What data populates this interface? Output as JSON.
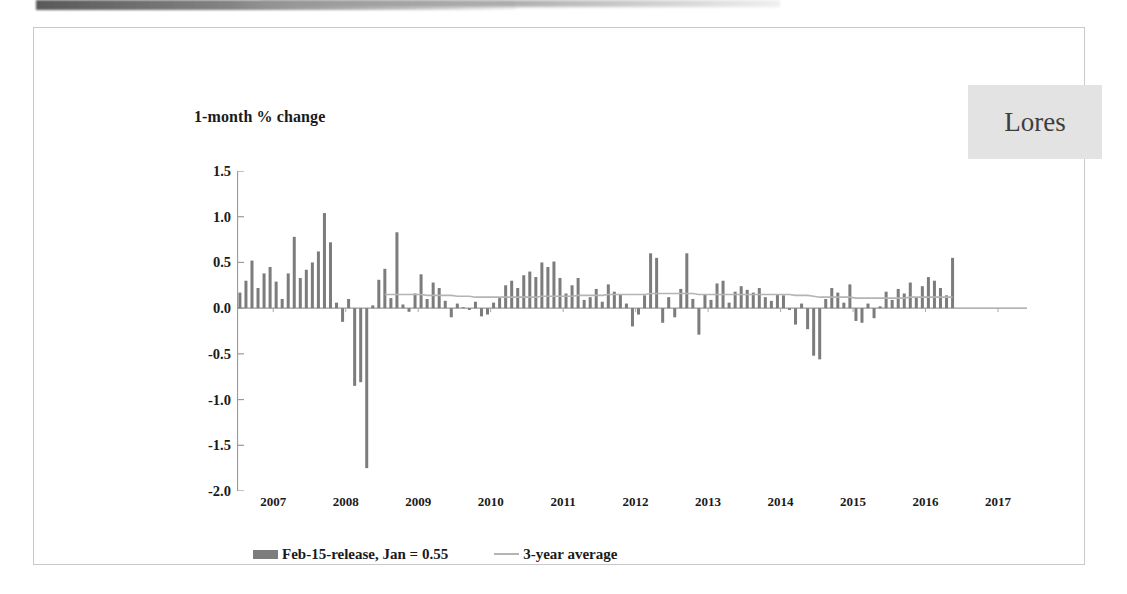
{
  "slide": {
    "watermark": "Lores"
  },
  "chart_data": {
    "type": "bar",
    "title": "1-month % change",
    "xlabel": "",
    "ylabel": "",
    "ylim": [
      -2.0,
      1.5
    ],
    "ytick_labels": [
      "1.5",
      "1.0",
      "0.5",
      "0.0",
      "-0.5",
      "-1.0",
      "-1.5",
      "-2.0"
    ],
    "yticks": [
      1.5,
      1.0,
      0.5,
      0.0,
      -0.5,
      -1.0,
      -1.5,
      -2.0
    ],
    "xtick_labels": [
      "2007",
      "2008",
      "2009",
      "2010",
      "2011",
      "2012",
      "2013",
      "2014",
      "2015",
      "2016",
      "2017"
    ],
    "xticks": [
      2007,
      2008,
      2009,
      2010,
      2011,
      2012,
      2013,
      2014,
      2015,
      2016,
      2017
    ],
    "xlim": [
      2006.5,
      2017.4
    ],
    "grid": false,
    "legend_position": "bottom",
    "legend": [
      {
        "name": "Feb-15-release, Jan = 0.55",
        "kind": "bar",
        "color": "#7c7c7c"
      },
      {
        "name": "3-year average",
        "kind": "line",
        "color": "#b4b4b4"
      }
    ],
    "bar_color": "#7c7c7c",
    "line_color": "#b4b4b4",
    "x_start": 2006.54,
    "x_step": 0.08333,
    "series": [
      {
        "name": "Feb-15-release, Jan = 0.55",
        "kind": "bar",
        "values": [
          0.17,
          0.3,
          0.52,
          0.22,
          0.38,
          0.45,
          0.29,
          0.1,
          0.38,
          0.78,
          0.33,
          0.42,
          0.5,
          0.62,
          1.04,
          0.72,
          0.06,
          -0.15,
          0.1,
          -0.85,
          -0.81,
          -1.75,
          0.03,
          0.31,
          0.43,
          0.11,
          0.83,
          0.04,
          -0.04,
          0.16,
          0.37,
          0.1,
          0.28,
          0.22,
          0.08,
          -0.1,
          0.05,
          0.01,
          -0.02,
          0.07,
          -0.09,
          -0.07,
          0.06,
          0.11,
          0.25,
          0.3,
          0.22,
          0.36,
          0.4,
          0.34,
          0.5,
          0.45,
          0.51,
          0.33,
          0.16,
          0.25,
          0.33,
          0.09,
          0.12,
          0.21,
          0.07,
          0.26,
          0.18,
          0.15,
          0.05,
          -0.2,
          -0.07,
          0.14,
          0.6,
          0.55,
          -0.16,
          0.12,
          -0.1,
          0.21,
          0.6,
          0.1,
          -0.29,
          0.15,
          0.09,
          0.27,
          0.3,
          0.06,
          0.18,
          0.24,
          0.2,
          0.17,
          0.22,
          0.12,
          0.08,
          0.15,
          0.14,
          -0.02,
          -0.18,
          0.05,
          -0.23,
          -0.52,
          -0.56,
          0.1,
          0.22,
          0.17,
          0.06,
          0.26,
          -0.14,
          -0.16,
          0.05,
          -0.11,
          0.02,
          0.18,
          0.09,
          0.21,
          0.16,
          0.28,
          0.12,
          0.24,
          0.34,
          0.3,
          0.22,
          0.14,
          0.55
        ]
      },
      {
        "name": "3-year average",
        "kind": "line",
        "values": [
          null,
          null,
          null,
          null,
          null,
          null,
          null,
          null,
          null,
          null,
          null,
          null,
          null,
          null,
          null,
          null,
          null,
          null,
          null,
          null,
          null,
          null,
          null,
          null,
          0.15,
          0.15,
          0.15,
          0.15,
          0.15,
          0.15,
          0.15,
          0.14,
          0.14,
          0.14,
          0.14,
          0.14,
          0.13,
          0.13,
          0.13,
          0.12,
          0.12,
          0.12,
          0.12,
          0.12,
          0.12,
          0.12,
          0.12,
          0.12,
          0.12,
          0.12,
          0.13,
          0.13,
          0.13,
          0.13,
          0.13,
          0.13,
          0.14,
          0.14,
          0.14,
          0.14,
          0.14,
          0.15,
          0.15,
          0.15,
          0.15,
          0.15,
          0.15,
          0.15,
          0.16,
          0.16,
          0.16,
          0.16,
          0.16,
          0.16,
          0.16,
          0.16,
          0.15,
          0.15,
          0.15,
          0.15,
          0.15,
          0.15,
          0.15,
          0.15,
          0.15,
          0.15,
          0.15,
          0.15,
          0.15,
          0.15,
          0.15,
          0.15,
          0.14,
          0.14,
          0.14,
          0.13,
          0.12,
          0.12,
          0.12,
          0.12,
          0.12,
          0.12,
          0.11,
          0.11,
          0.11,
          0.11,
          0.11,
          0.11,
          0.11,
          0.11,
          0.11,
          0.12,
          0.12,
          0.12,
          0.12,
          0.12,
          0.12,
          0.12,
          0.12
        ]
      }
    ]
  }
}
